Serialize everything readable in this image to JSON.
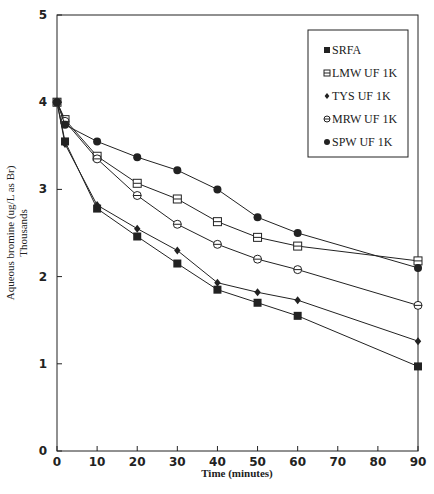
{
  "chart_data": {
    "type": "line",
    "title": "",
    "xlabel": "Time (minutes)",
    "ylabel": "Aqueous bromine (ug/L as Br)",
    "ylabel_secondary": "Thousands",
    "xlim": [
      0,
      90
    ],
    "ylim": [
      0,
      5
    ],
    "xticks": [
      0,
      10,
      20,
      30,
      40,
      50,
      60,
      70,
      80,
      90
    ],
    "yticks": [
      0,
      1,
      2,
      3,
      4,
      5
    ],
    "grid": false,
    "legend_position": "upper right",
    "x": [
      0,
      2,
      10,
      20,
      30,
      40,
      50,
      60,
      90
    ],
    "series": [
      {
        "name": "SRFA",
        "marker": "filled-square",
        "values": [
          4.0,
          3.55,
          2.78,
          2.46,
          2.15,
          1.85,
          1.7,
          1.55,
          0.97
        ]
      },
      {
        "name": "LMW UF 1K",
        "marker": "hollow-square",
        "values": [
          4.0,
          3.8,
          3.38,
          3.07,
          2.89,
          2.63,
          2.45,
          2.35,
          2.18
        ]
      },
      {
        "name": "TYS UF 1K",
        "marker": "filled-diamond",
        "values": [
          4.0,
          3.52,
          2.82,
          2.55,
          2.3,
          1.93,
          1.82,
          1.73,
          1.26
        ]
      },
      {
        "name": "MRW UF 1K",
        "marker": "hollow-circle",
        "values": [
          4.0,
          3.78,
          3.35,
          2.93,
          2.6,
          2.37,
          2.2,
          2.08,
          1.67
        ]
      },
      {
        "name": "SPW UF 1K",
        "marker": "filled-circle",
        "values": [
          4.0,
          3.74,
          3.55,
          3.37,
          3.22,
          3.0,
          2.68,
          2.5,
          2.1
        ]
      }
    ]
  },
  "colors": {
    "line": "#222222",
    "background": "#ffffff"
  }
}
